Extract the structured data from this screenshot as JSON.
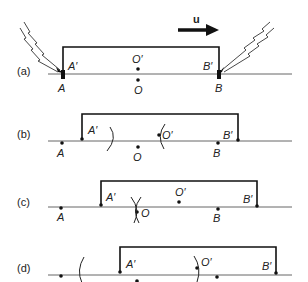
{
  "diagram": {
    "velocity_label": "u",
    "panels": [
      {
        "id": "a",
        "label": "(a)",
        "ground_points": [
          {
            "name": "A",
            "label": "A"
          },
          {
            "name": "O",
            "label": "O"
          },
          {
            "name": "B",
            "label": "B"
          }
        ],
        "train_points": [
          {
            "name": "A'",
            "label": "A′"
          },
          {
            "name": "O'",
            "label": "O′"
          },
          {
            "name": "B'",
            "label": "B′"
          }
        ],
        "lightning": [
          "at A",
          "at B"
        ]
      },
      {
        "id": "b",
        "label": "(b)",
        "ground_points": [
          {
            "name": "A",
            "label": "A"
          },
          {
            "name": "O",
            "label": "O"
          },
          {
            "name": "B",
            "label": "B"
          }
        ],
        "train_points": [
          {
            "name": "A'",
            "label": "A′"
          },
          {
            "name": "O'",
            "label": "O′"
          },
          {
            "name": "B'",
            "label": "B′"
          }
        ]
      },
      {
        "id": "c",
        "label": "(c)",
        "ground_points": [
          {
            "name": "A",
            "label": "A"
          },
          {
            "name": "O",
            "label": "O"
          },
          {
            "name": "B",
            "label": "B"
          }
        ],
        "train_points": [
          {
            "name": "A'",
            "label": "A′"
          },
          {
            "name": "O'",
            "label": "O′"
          },
          {
            "name": "B'",
            "label": "B′"
          }
        ]
      },
      {
        "id": "d",
        "label": "(d)",
        "train_points": [
          {
            "name": "A'",
            "label": "A′"
          },
          {
            "name": "O'",
            "label": "O′"
          },
          {
            "name": "B'",
            "label": "B′"
          }
        ]
      }
    ]
  }
}
